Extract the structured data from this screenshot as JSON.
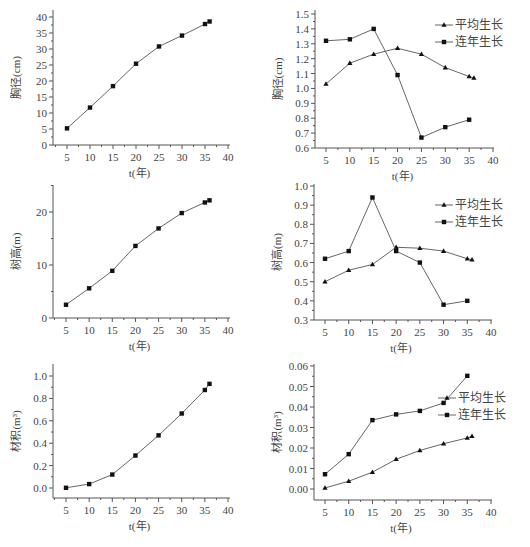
{
  "figure": {
    "x_axis_title": "t(年)",
    "legend": {
      "avg": "平均生长",
      "annual": "连年生长"
    }
  },
  "chart_data": [
    {
      "id": "dbh-total",
      "type": "line",
      "title": "",
      "xlabel": "t(年)",
      "ylabel": "胸径(cm)",
      "xlim": [
        3,
        40
      ],
      "ylim": [
        0,
        40
      ],
      "xticks": [
        5,
        10,
        15,
        20,
        25,
        30,
        35,
        40
      ],
      "yticks": [
        0,
        5,
        10,
        15,
        20,
        25,
        30,
        35,
        40
      ],
      "grid": false,
      "series": [
        {
          "name": "胸径",
          "marker": "square",
          "x": [
            5,
            10,
            15,
            20,
            25,
            30,
            35,
            36
          ],
          "y": [
            5.2,
            11.7,
            18.4,
            25.4,
            30.8,
            34.2,
            37.8,
            38.6
          ]
        }
      ],
      "box": {
        "left": 53,
        "right": 230,
        "top": 10,
        "bottom": 145,
        "xmin_px": 67,
        "xmax_px": 228,
        "ymin_px": 145,
        "ymax_px": 17
      }
    },
    {
      "id": "dbh-growth",
      "type": "line",
      "title": "",
      "xlabel": "t(年)",
      "ylabel": "胸径(cm)",
      "xlim": [
        3,
        40
      ],
      "ylim": [
        0.6,
        1.5
      ],
      "xticks": [
        5,
        10,
        15,
        20,
        25,
        30,
        35,
        40
      ],
      "yticks": [
        0.6,
        0.7,
        0.8,
        0.9,
        1.0,
        1.1,
        1.2,
        1.3,
        1.4,
        1.5
      ],
      "ytick_labels": [
        "0.6",
        "0.7",
        "0.8",
        "0.9",
        "1.0",
        "1.1",
        "1.2",
        "1.3",
        "1.4",
        "1.5"
      ],
      "grid": false,
      "legend_position": "upper right",
      "series": [
        {
          "name": "平均生长",
          "marker": "triangle",
          "x": [
            5,
            10,
            15,
            20,
            25,
            30,
            35,
            36
          ],
          "y": [
            1.03,
            1.17,
            1.23,
            1.27,
            1.23,
            1.14,
            1.08,
            1.07
          ]
        },
        {
          "name": "连年生长",
          "marker": "square",
          "x": [
            5,
            10,
            15,
            20,
            25,
            30,
            35
          ],
          "y": [
            1.32,
            1.33,
            1.4,
            1.09,
            0.67,
            0.74,
            0.79
          ]
        }
      ],
      "box": {
        "left": 315,
        "right": 494,
        "top": 10,
        "bottom": 148,
        "xmin_px": 326,
        "xmax_px": 493,
        "ymin_px": 148,
        "ymax_px": 14
      },
      "legend_box": {
        "x": 455,
        "y": 25
      }
    },
    {
      "id": "height-total",
      "type": "line",
      "title": "",
      "xlabel": "t(年)",
      "ylabel": "树高(m)",
      "xlim": [
        3,
        40
      ],
      "ylim": [
        0,
        25
      ],
      "xticks": [
        5,
        10,
        15,
        20,
        25,
        30,
        35,
        40
      ],
      "yticks": [
        0,
        10,
        20
      ],
      "minor_yticks": [
        5,
        15,
        25
      ],
      "grid": false,
      "series": [
        {
          "name": "树高",
          "marker": "square",
          "x": [
            5,
            10,
            15,
            20,
            25,
            30,
            35,
            36
          ],
          "y": [
            2.5,
            5.6,
            8.9,
            13.6,
            16.9,
            19.8,
            21.8,
            22.2
          ]
        }
      ],
      "box": {
        "left": 53,
        "right": 230,
        "top": 185,
        "bottom": 318,
        "xmin_px": 66,
        "xmax_px": 228,
        "ymin_px": 318,
        "ymax_px": 212,
        "ymax_val": 20
      }
    },
    {
      "id": "height-growth",
      "type": "line",
      "title": "",
      "xlabel": "t(年)",
      "ylabel": "树高(m)",
      "xlim": [
        3,
        40
      ],
      "ylim": [
        0.3,
        1.0
      ],
      "xticks": [
        5,
        10,
        15,
        20,
        25,
        30,
        35,
        40
      ],
      "yticks": [
        0.3,
        0.4,
        0.5,
        0.6,
        0.7,
        0.8,
        0.9,
        1.0
      ],
      "ytick_labels": [
        "0.3",
        "0.4",
        "0.5",
        "0.6",
        "0.7",
        "0.8",
        "0.9",
        "1.0"
      ],
      "grid": false,
      "legend_position": "upper right",
      "series": [
        {
          "name": "平均生长",
          "marker": "triangle",
          "x": [
            5,
            10,
            15,
            20,
            25,
            30,
            35,
            36
          ],
          "y": [
            0.5,
            0.56,
            0.59,
            0.68,
            0.675,
            0.66,
            0.62,
            0.615
          ]
        },
        {
          "name": "连年生长",
          "marker": "square",
          "x": [
            5,
            10,
            15,
            20,
            25,
            30,
            35
          ],
          "y": [
            0.62,
            0.66,
            0.94,
            0.66,
            0.6,
            0.38,
            0.4
          ]
        }
      ],
      "box": {
        "left": 314,
        "right": 492,
        "top": 184,
        "bottom": 320,
        "xmin_px": 325,
        "xmax_px": 491,
        "ymin_px": 320,
        "ymax_px": 186
      },
      "legend_box": {
        "x": 455,
        "y": 205
      }
    },
    {
      "id": "volume-total",
      "type": "line",
      "title": "",
      "xlabel": "t(年)",
      "ylabel": "材积(m³)",
      "xlim": [
        3,
        40
      ],
      "ylim": [
        -0.1,
        1.1
      ],
      "xticks": [
        5,
        10,
        15,
        20,
        25,
        30,
        35,
        40
      ],
      "yticks": [
        0.0,
        0.2,
        0.4,
        0.6,
        0.8,
        1.0
      ],
      "ytick_labels": [
        "0.0",
        "0.2",
        "0.4",
        "0.6",
        "0.8",
        "1.0"
      ],
      "grid": false,
      "series": [
        {
          "name": "材积",
          "marker": "square",
          "x": [
            5,
            10,
            15,
            20,
            25,
            30,
            35,
            36
          ],
          "y": [
            0.002,
            0.035,
            0.12,
            0.29,
            0.47,
            0.665,
            0.875,
            0.93
          ]
        }
      ],
      "box": {
        "left": 53,
        "right": 230,
        "top": 364,
        "bottom": 498,
        "xmin_px": 66,
        "xmax_px": 228,
        "ymin_px": 488,
        "ymax_px": 376
      }
    },
    {
      "id": "volume-growth",
      "type": "line",
      "title": "",
      "xlabel": "t(年)",
      "ylabel": "材积(m³)",
      "xlim": [
        3,
        40
      ],
      "ylim": [
        -0.005,
        0.06
      ],
      "xticks": [
        5,
        10,
        15,
        20,
        25,
        30,
        35,
        40
      ],
      "yticks": [
        0.0,
        0.01,
        0.02,
        0.03,
        0.04,
        0.05,
        0.06
      ],
      "ytick_labels": [
        "0.00",
        "0.01",
        "0.02",
        "0.03",
        "0.04",
        "0.05",
        "0.06"
      ],
      "grid": false,
      "legend_position": "right",
      "series": [
        {
          "name": "平均生长",
          "marker": "triangle",
          "x": [
            5,
            10,
            15,
            20,
            25,
            30,
            35,
            36
          ],
          "y": [
            0.0005,
            0.0038,
            0.0082,
            0.0145,
            0.0188,
            0.0221,
            0.0249,
            0.0257
          ]
        },
        {
          "name": "连年生长",
          "marker": "square",
          "x": [
            5,
            10,
            15,
            20,
            25,
            30,
            35
          ],
          "y": [
            0.0072,
            0.017,
            0.0336,
            0.0364,
            0.0381,
            0.042,
            0.0552
          ]
        }
      ],
      "box": {
        "left": 314,
        "right": 492,
        "top": 364,
        "bottom": 500,
        "xmin_px": 325,
        "xmax_px": 491,
        "ymin_px": 489,
        "ymax_px": 366
      },
      "legend_box": {
        "x": 458,
        "y": 398
      }
    }
  ]
}
